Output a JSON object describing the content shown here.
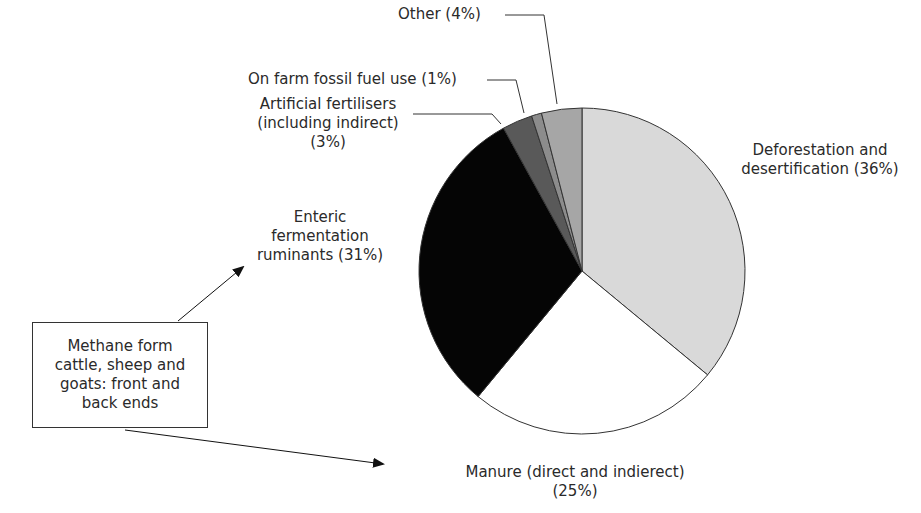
{
  "chart_data": {
    "type": "pie",
    "title": "",
    "start_angle_deg": 0,
    "direction": "clockwise",
    "slices": [
      {
        "label": "Deforestation and desertification",
        "value": 36,
        "color": "#d9d9d9"
      },
      {
        "label": "Manure (direct and indierect)",
        "value": 25,
        "color": "#ffffff"
      },
      {
        "label": "Enteric fermentation ruminants",
        "value": 31,
        "color": "#050505"
      },
      {
        "label": "Artificial fertilisers (including indirect)",
        "value": 3,
        "color": "#595959"
      },
      {
        "label": "On farm fossil fuel use",
        "value": 1,
        "color": "#8c8c8c"
      },
      {
        "label": "Other",
        "value": 4,
        "color": "#a6a6a6"
      }
    ],
    "categories": [
      "Deforestation and desertification",
      "Manure (direct and indierect)",
      "Enteric fermentation ruminants",
      "Artificial fertilisers (including indirect)",
      "On farm fossil fuel use",
      "Other"
    ],
    "values": [
      36,
      25,
      31,
      3,
      1,
      4
    ],
    "legend": "none (direct labels)",
    "annotation": "Methane form cattle, sheep and goats: front and back ends"
  },
  "labels": {
    "other": "Other (4%)",
    "fossil": "On farm fossil fuel use (1%)",
    "fert_line1": "Artificial fertilisers",
    "fert_line2": "(including indirect)",
    "fert_line3": "(3%)",
    "defor_line1": "Deforestation and",
    "defor_line2": "desertification (36%)",
    "enteric_line1": "Enteric",
    "enteric_line2": "fermentation",
    "enteric_line3": "ruminants (31%)",
    "manure_line1": "Manure (direct and indierect)",
    "manure_line2": "(25%)"
  },
  "annotation_box": {
    "line1": "Methane form",
    "line2": "cattle, sheep and",
    "line3": "goats: front and",
    "line4": "back ends"
  }
}
